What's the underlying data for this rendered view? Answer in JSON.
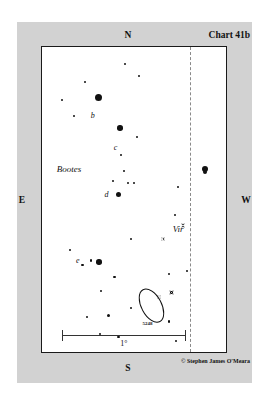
{
  "chart": {
    "title": "Chart 41b",
    "credit": "© Stephen James O'Meara",
    "cardinals": {
      "north": "N",
      "south": "S",
      "east": "E",
      "west": "W"
    },
    "scale": {
      "label": "1°",
      "bar_left_pct": 11,
      "bar_width_pct": 67
    },
    "boundary_line": {
      "style": "dashed",
      "x_pct": 80.5,
      "color": "#8a8a8a"
    },
    "colors": {
      "margin": "#d2d2d2",
      "plot_background": "#ffffff",
      "frame": "#1a1a1a",
      "ink": "#111111"
    }
  },
  "chart_data": {
    "type": "scatter",
    "title": "Chart 41b",
    "xlabel": "",
    "ylabel": "",
    "xlim": [
      0,
      100
    ],
    "ylim": [
      0,
      100
    ],
    "grid": false,
    "legend": null,
    "constellation_labels": [
      {
        "name": "Bootes",
        "x": 8.0,
        "y": 38.5
      },
      {
        "name": "Vir",
        "x": 71.0,
        "y": 58.0
      }
    ],
    "star_labels": [
      {
        "name": "b",
        "x": 26.5,
        "y": 21.0
      },
      {
        "name": "c",
        "x": 39.0,
        "y": 31.5
      },
      {
        "name": "d",
        "x": 34.0,
        "y": 47.0
      },
      {
        "name": "e",
        "x": 18.5,
        "y": 68.5
      }
    ],
    "objects": [
      {
        "name": "5248",
        "kind": "galaxy",
        "x": 59.0,
        "y": 84.5,
        "width_pct": 10.5,
        "height_pct": 5.5,
        "angle_deg": -28
      }
    ],
    "stars": [
      {
        "x": 45.0,
        "y": 5.5,
        "mag_size": 2.0,
        "style": "filled"
      },
      {
        "x": 52.5,
        "y": 9.5,
        "mag_size": 2.0,
        "style": "filled"
      },
      {
        "x": 23.5,
        "y": 11.5,
        "mag_size": 2.2,
        "style": "filled"
      },
      {
        "x": 30.5,
        "y": 16.5,
        "mag_size": 7.0,
        "style": "filled"
      },
      {
        "x": 11.0,
        "y": 17.5,
        "mag_size": 2.2,
        "style": "filled"
      },
      {
        "x": 17.5,
        "y": 22.5,
        "mag_size": 2.0,
        "style": "filled"
      },
      {
        "x": 42.5,
        "y": 26.5,
        "mag_size": 5.5,
        "style": "filled"
      },
      {
        "x": 51.5,
        "y": 29.5,
        "mag_size": 2.0,
        "style": "filled"
      },
      {
        "x": 43.0,
        "y": 35.5,
        "mag_size": 2.2,
        "style": "filled"
      },
      {
        "x": 44.5,
        "y": 40.5,
        "mag_size": 2.0,
        "style": "filled"
      },
      {
        "x": 38.5,
        "y": 44.0,
        "mag_size": 2.2,
        "style": "filled"
      },
      {
        "x": 47.0,
        "y": 44.5,
        "mag_size": 2.0,
        "style": "filled"
      },
      {
        "x": 50.0,
        "y": 44.5,
        "mag_size": 2.0,
        "style": "filled"
      },
      {
        "x": 88.5,
        "y": 40.0,
        "mag_size": 6.0,
        "style": "double"
      },
      {
        "x": 74.0,
        "y": 46.0,
        "mag_size": 2.2,
        "style": "filled"
      },
      {
        "x": 41.5,
        "y": 48.5,
        "mag_size": 5.0,
        "style": "filled"
      },
      {
        "x": 72.5,
        "y": 55.0,
        "mag_size": 2.2,
        "style": "filled"
      },
      {
        "x": 76.5,
        "y": 58.5,
        "mag_size": 4.5,
        "style": "ringed"
      },
      {
        "x": 48.5,
        "y": 63.0,
        "mag_size": 2.2,
        "style": "filled"
      },
      {
        "x": 65.5,
        "y": 63.0,
        "mag_size": 4.0,
        "style": "ringed"
      },
      {
        "x": 15.0,
        "y": 66.5,
        "mag_size": 2.2,
        "style": "filled"
      },
      {
        "x": 22.0,
        "y": 71.5,
        "mag_size": 2.2,
        "style": "filled"
      },
      {
        "x": 26.5,
        "y": 70.0,
        "mag_size": 2.2,
        "style": "filled"
      },
      {
        "x": 31.0,
        "y": 70.5,
        "mag_size": 5.5,
        "style": "filled"
      },
      {
        "x": 39.5,
        "y": 75.5,
        "mag_size": 2.4,
        "style": "filled"
      },
      {
        "x": 69.0,
        "y": 74.5,
        "mag_size": 2.2,
        "style": "filled"
      },
      {
        "x": 79.0,
        "y": 73.5,
        "mag_size": 2.2,
        "style": "filled"
      },
      {
        "x": 32.0,
        "y": 80.0,
        "mag_size": 2.4,
        "style": "filled"
      },
      {
        "x": 70.5,
        "y": 80.5,
        "mag_size": 4.5,
        "style": "ringed"
      },
      {
        "x": 63.5,
        "y": 82.0,
        "mag_size": 4.0,
        "style": "ringed"
      },
      {
        "x": 48.5,
        "y": 85.5,
        "mag_size": 2.4,
        "style": "filled"
      },
      {
        "x": 24.5,
        "y": 88.5,
        "mag_size": 2.4,
        "style": "filled"
      },
      {
        "x": 36.0,
        "y": 88.0,
        "mag_size": 3.0,
        "style": "filled"
      },
      {
        "x": 31.5,
        "y": 94.0,
        "mag_size": 2.4,
        "style": "filled"
      },
      {
        "x": 41.5,
        "y": 95.0,
        "mag_size": 2.4,
        "style": "filled"
      },
      {
        "x": 69.0,
        "y": 90.0,
        "mag_size": 2.2,
        "style": "filled"
      },
      {
        "x": 73.0,
        "y": 96.5,
        "mag_size": 2.2,
        "style": "filled"
      }
    ]
  }
}
